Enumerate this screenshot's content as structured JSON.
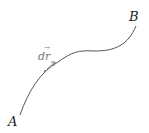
{
  "diagram": {
    "start_label": "A",
    "end_label": "B",
    "element_label": "dr",
    "vector_mark": "→",
    "curve_color": "#555555",
    "label_color": "#222222",
    "element_color": "#777777"
  }
}
